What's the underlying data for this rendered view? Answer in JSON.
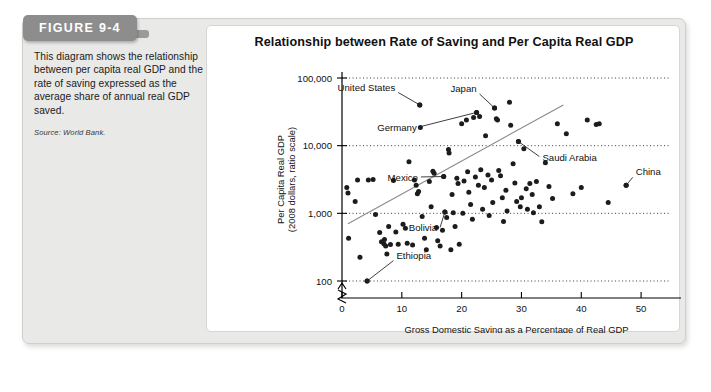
{
  "running_head": "",
  "figure": {
    "badge_label": "FIGURE 9-4",
    "caption": "This diagram shows the relationship between per capita real GDP and the rate of saving expressed as the average share of annual real GDP saved.",
    "source": "Source: World Bank."
  },
  "chart_data": {
    "type": "scatter",
    "title": "Relationship between Rate of Saving and Per Capita Real GDP",
    "xlabel": "Gross Domestic Saving as a Percentage of Real GDP",
    "ylabel": "Per Capita Real GDP",
    "ylabel_line2": "(2008 dollars, ratio scale)",
    "yscale": "log",
    "ylim": [
      100,
      100000
    ],
    "xlim": [
      0,
      55
    ],
    "grid": true,
    "legend": "none",
    "axis_break_y": true,
    "xticks": [
      0,
      10,
      20,
      30,
      40,
      50
    ],
    "xtick_labels": [
      "0",
      "10",
      "20",
      "30",
      "40",
      "50"
    ],
    "yticks": [
      100,
      1000,
      10000,
      100000
    ],
    "ytick_labels": [
      "100",
      "1,000",
      "10,000",
      "100,000"
    ],
    "trendline": {
      "x0": 1.0,
      "y0": 700,
      "x1": 37.0,
      "y1": 40000
    },
    "annotations": [
      {
        "label": "United States",
        "x": 13.0,
        "y": 40000,
        "lx": 9.4,
        "ly": 61000
      },
      {
        "label": "Japan",
        "x": 25.5,
        "y": 36000,
        "lx": 23.0,
        "ly": 58000
      },
      {
        "label": "Germany",
        "x": 22.5,
        "y": 31000,
        "lx": 13.0,
        "ly": 19000
      },
      {
        "label": "Saudi Arabia",
        "x": 29.5,
        "y": 11500,
        "lx": 33.0,
        "ly": 6900
      },
      {
        "label": "China",
        "x": 47.5,
        "y": 2600,
        "lx": 48.6,
        "ly": 3400
      },
      {
        "label": "Mexico",
        "x": 17.0,
        "y": 3500,
        "lx": 13.2,
        "ly": 3450
      },
      {
        "label": "Bolivia",
        "x": 17.2,
        "y": 1050,
        "lx": 16.4,
        "ly": 620
      },
      {
        "label": "Ethiopia",
        "x": 4.2,
        "y": 100,
        "lx": 8.6,
        "ly": 200
      }
    ],
    "points": [
      {
        "x": 0.8,
        "y": 2400
      },
      {
        "x": 1.0,
        "y": 2000
      },
      {
        "x": 1.1,
        "y": 430
      },
      {
        "x": 2.2,
        "y": 1500
      },
      {
        "x": 2.6,
        "y": 3100
      },
      {
        "x": 3.0,
        "y": 225
      },
      {
        "x": 4.2,
        "y": 100
      },
      {
        "x": 4.4,
        "y": 3100
      },
      {
        "x": 5.2,
        "y": 3150
      },
      {
        "x": 5.6,
        "y": 960
      },
      {
        "x": 6.3,
        "y": 520
      },
      {
        "x": 6.6,
        "y": 380
      },
      {
        "x": 7.0,
        "y": 355
      },
      {
        "x": 7.1,
        "y": 410
      },
      {
        "x": 7.3,
        "y": 330
      },
      {
        "x": 7.5,
        "y": 250
      },
      {
        "x": 7.8,
        "y": 640
      },
      {
        "x": 8.1,
        "y": 345
      },
      {
        "x": 8.6,
        "y": 3050
      },
      {
        "x": 9.0,
        "y": 530
      },
      {
        "x": 9.4,
        "y": 350
      },
      {
        "x": 10.2,
        "y": 690
      },
      {
        "x": 10.6,
        "y": 600
      },
      {
        "x": 10.9,
        "y": 360
      },
      {
        "x": 11.2,
        "y": 5800
      },
      {
        "x": 11.8,
        "y": 340
      },
      {
        "x": 12.1,
        "y": 3100
      },
      {
        "x": 12.4,
        "y": 2600
      },
      {
        "x": 12.6,
        "y": 1950
      },
      {
        "x": 12.8,
        "y": 2100
      },
      {
        "x": 13.0,
        "y": 40000
      },
      {
        "x": 13.1,
        "y": 18500
      },
      {
        "x": 13.4,
        "y": 900
      },
      {
        "x": 13.8,
        "y": 430
      },
      {
        "x": 14.1,
        "y": 290
      },
      {
        "x": 14.6,
        "y": 2950
      },
      {
        "x": 14.9,
        "y": 1250
      },
      {
        "x": 15.2,
        "y": 4200
      },
      {
        "x": 15.4,
        "y": 3900
      },
      {
        "x": 15.8,
        "y": 620
      },
      {
        "x": 16.0,
        "y": 395
      },
      {
        "x": 16.4,
        "y": 330
      },
      {
        "x": 16.8,
        "y": 560
      },
      {
        "x": 17.0,
        "y": 3500
      },
      {
        "x": 17.2,
        "y": 1050
      },
      {
        "x": 17.5,
        "y": 870
      },
      {
        "x": 17.8,
        "y": 8800
      },
      {
        "x": 17.9,
        "y": 7800
      },
      {
        "x": 18.2,
        "y": 290
      },
      {
        "x": 18.4,
        "y": 1900
      },
      {
        "x": 18.6,
        "y": 1020
      },
      {
        "x": 18.9,
        "y": 640
      },
      {
        "x": 19.2,
        "y": 3300
      },
      {
        "x": 19.4,
        "y": 2750
      },
      {
        "x": 19.6,
        "y": 350
      },
      {
        "x": 20.0,
        "y": 21000
      },
      {
        "x": 20.2,
        "y": 1000
      },
      {
        "x": 20.4,
        "y": 3000
      },
      {
        "x": 20.8,
        "y": 24000
      },
      {
        "x": 21.0,
        "y": 4100
      },
      {
        "x": 21.2,
        "y": 2050
      },
      {
        "x": 21.5,
        "y": 1350
      },
      {
        "x": 21.8,
        "y": 820
      },
      {
        "x": 22.0,
        "y": 26000
      },
      {
        "x": 22.3,
        "y": 3450
      },
      {
        "x": 22.5,
        "y": 31000
      },
      {
        "x": 22.8,
        "y": 2600
      },
      {
        "x": 23.0,
        "y": 27000
      },
      {
        "x": 23.2,
        "y": 4400
      },
      {
        "x": 23.5,
        "y": 1150
      },
      {
        "x": 23.8,
        "y": 2400
      },
      {
        "x": 24.0,
        "y": 14000
      },
      {
        "x": 24.4,
        "y": 3700
      },
      {
        "x": 24.6,
        "y": 930
      },
      {
        "x": 25.0,
        "y": 3100
      },
      {
        "x": 25.2,
        "y": 1450
      },
      {
        "x": 25.5,
        "y": 36000
      },
      {
        "x": 25.8,
        "y": 25000
      },
      {
        "x": 26.0,
        "y": 24000
      },
      {
        "x": 26.2,
        "y": 4300
      },
      {
        "x": 26.5,
        "y": 3600
      },
      {
        "x": 26.8,
        "y": 1700
      },
      {
        "x": 27.0,
        "y": 760
      },
      {
        "x": 27.4,
        "y": 2200
      },
      {
        "x": 27.6,
        "y": 1080
      },
      {
        "x": 28.0,
        "y": 44000
      },
      {
        "x": 28.2,
        "y": 20000
      },
      {
        "x": 28.6,
        "y": 5400
      },
      {
        "x": 28.9,
        "y": 2800
      },
      {
        "x": 29.2,
        "y": 1500
      },
      {
        "x": 29.5,
        "y": 11500
      },
      {
        "x": 29.8,
        "y": 1250
      },
      {
        "x": 30.0,
        "y": 1700
      },
      {
        "x": 30.4,
        "y": 9000
      },
      {
        "x": 30.8,
        "y": 2300
      },
      {
        "x": 31.0,
        "y": 1150
      },
      {
        "x": 31.4,
        "y": 2750
      },
      {
        "x": 31.8,
        "y": 1900
      },
      {
        "x": 32.0,
        "y": 1020
      },
      {
        "x": 32.5,
        "y": 2950
      },
      {
        "x": 33.0,
        "y": 1250
      },
      {
        "x": 33.4,
        "y": 750
      },
      {
        "x": 34.0,
        "y": 5600
      },
      {
        "x": 34.6,
        "y": 2500
      },
      {
        "x": 35.2,
        "y": 1650
      },
      {
        "x": 36.0,
        "y": 21000
      },
      {
        "x": 37.5,
        "y": 15000
      },
      {
        "x": 38.6,
        "y": 1950
      },
      {
        "x": 40.0,
        "y": 2400
      },
      {
        "x": 41.0,
        "y": 24000
      },
      {
        "x": 42.5,
        "y": 20500
      },
      {
        "x": 43.0,
        "y": 21000
      },
      {
        "x": 44.5,
        "y": 1450
      },
      {
        "x": 47.5,
        "y": 2600
      }
    ]
  }
}
